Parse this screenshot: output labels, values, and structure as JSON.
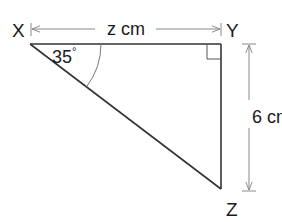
{
  "diagram": {
    "type": "right-triangle",
    "vertices": {
      "X": {
        "label": "X"
      },
      "Y": {
        "label": "Y"
      },
      "Z": {
        "label": "Z"
      }
    },
    "angle": {
      "vertex": "X",
      "label": "35",
      "degree_symbol": "°"
    },
    "right_angle_at": "Y",
    "dimensions": {
      "top": {
        "between": [
          "X",
          "Y"
        ],
        "label": "z cm"
      },
      "right": {
        "between": [
          "Y",
          "Z"
        ],
        "label": "6 cm"
      }
    },
    "colors": {
      "stroke": "#333333",
      "dimension_line": "#888888",
      "arc": "#777777",
      "text": "#1a1a1a"
    }
  }
}
